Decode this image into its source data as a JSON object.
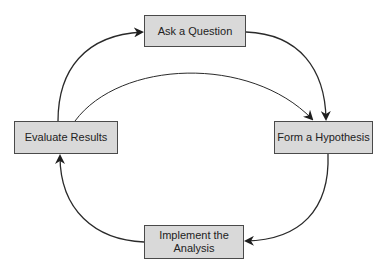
{
  "diagram": {
    "type": "cycle",
    "nodes": [
      {
        "id": "ask",
        "label": "Ask a Question"
      },
      {
        "id": "form",
        "label": "Form a Hypothesis"
      },
      {
        "id": "implement",
        "label": "Implement the Analysis",
        "lines": [
          "Implement the",
          "Analysis"
        ]
      },
      {
        "id": "evaluate",
        "label": "Evaluate Results"
      }
    ],
    "edges": [
      {
        "from": "ask",
        "to": "form"
      },
      {
        "from": "form",
        "to": "implement"
      },
      {
        "from": "implement",
        "to": "evaluate"
      },
      {
        "from": "evaluate",
        "to": "ask"
      },
      {
        "from": "evaluate",
        "to": "form"
      }
    ],
    "colors": {
      "node_fill": "#d9d9d9",
      "node_border": "#4a4a4a",
      "arrow": "#2a2a2a",
      "background": "#ffffff"
    }
  }
}
